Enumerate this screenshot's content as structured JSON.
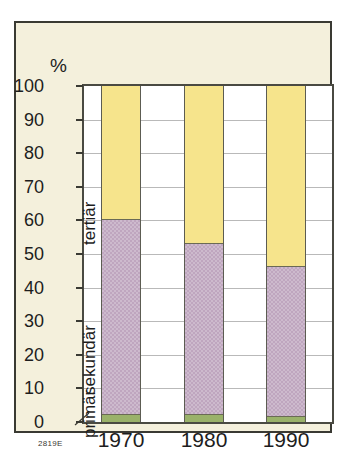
{
  "figure": {
    "id_code": "2819E",
    "unit_label": "%"
  },
  "chart_data": {
    "type": "bar",
    "stacked": true,
    "title": "",
    "subtitle": "",
    "xlabel": "",
    "ylabel": "%",
    "ylim": [
      0,
      100
    ],
    "yticks": [
      0,
      10,
      20,
      30,
      40,
      50,
      60,
      70,
      80,
      90,
      100
    ],
    "ytick_labels": [
      "0",
      "10",
      "20",
      "30",
      "40",
      "50",
      "60",
      "70",
      "80",
      "90",
      "100"
    ],
    "grid": true,
    "legend_position": "inline-left",
    "categories": [
      "1970",
      "1980",
      "1990"
    ],
    "series": [
      {
        "name": "primär",
        "color": "#9ab26a",
        "values": [
          2,
          2,
          1.5
        ]
      },
      {
        "name": "sekundär",
        "color": "#bfa6bf",
        "values": [
          58,
          51,
          44.5
        ]
      },
      {
        "name": "tertiär",
        "color": "#f6e48c",
        "values": [
          40,
          47,
          54
        ]
      }
    ],
    "cumulative_tops": {
      "primär": [
        2,
        2,
        1.5
      ],
      "sekundär": [
        60,
        53,
        46
      ],
      "tertiär": [
        100,
        100,
        100
      ]
    },
    "annotations": [
      {
        "text": "tertiär",
        "orientation": "vertical"
      },
      {
        "text": "sekundär",
        "orientation": "vertical"
      },
      {
        "text": "primär",
        "orientation": "vertical"
      }
    ]
  },
  "colors": {
    "panel_background": "#f4f0dc",
    "plot_background": "#ffffff",
    "frame": "#3a3a33",
    "gridline": "#b9b9b9",
    "tertiary": "#f6e48c",
    "secondary": "#bfa6bf",
    "primary": "#9ab26a",
    "text": "#1d1d1d"
  }
}
